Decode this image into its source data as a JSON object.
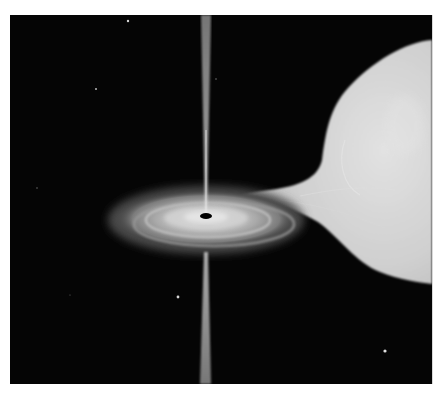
{
  "image": {
    "subject": "Artist illustration of a black hole accreting matter from a companion star",
    "width": 443,
    "height": 394,
    "frame": {
      "x": 10,
      "y": 15,
      "width": 422,
      "height": 369
    },
    "colors": {
      "background": "#ffffff",
      "space": "#050505",
      "star_light": "#d6d6d6",
      "star_mid": "#b9b9b9",
      "disk_outer": "#5a5a5a",
      "disk_inner": "#d0d0d0",
      "jet": "#bdbdbd",
      "black_hole": "#000000"
    }
  },
  "elements": {
    "companion_star": {
      "label": "companion-star",
      "cx": 440,
      "cy": 150,
      "rx": 105,
      "ry": 130
    },
    "accretion_stream": {
      "label": "accretion-stream"
    },
    "accretion_disk": {
      "label": "accretion-disk",
      "cx": 206,
      "cy": 218,
      "rx": 95,
      "ry": 30
    },
    "black_hole": {
      "label": "black-hole",
      "cx": 206,
      "cy": 216,
      "rx": 6,
      "ry": 3
    },
    "jets": {
      "label": "relativistic-jets",
      "x": 205
    },
    "background_stars": [
      {
        "x": 128,
        "y": 21,
        "r": 1.2
      },
      {
        "x": 96,
        "y": 89,
        "r": 1.0
      },
      {
        "x": 216,
        "y": 79,
        "r": 0.7
      },
      {
        "x": 37,
        "y": 188,
        "r": 0.7
      },
      {
        "x": 70,
        "y": 295,
        "r": 0.6
      },
      {
        "x": 178,
        "y": 297,
        "r": 1.4
      },
      {
        "x": 385,
        "y": 351,
        "r": 1.6
      }
    ]
  }
}
